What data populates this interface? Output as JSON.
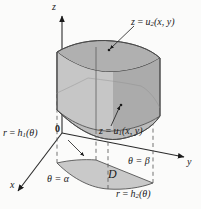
{
  "figure": {
    "background_color": "#fbfbfa",
    "axes": {
      "z_label": "z",
      "y_label": "y",
      "x_label": "x",
      "origin_label": "0",
      "axis_color": "#2b2b2b"
    },
    "labels": {
      "top_surface": {
        "lhs": "z",
        "eq": " = ",
        "fn": "u",
        "sub": "2",
        "args": "(x, y)"
      },
      "bottom_surface": {
        "lhs": "z",
        "eq": " = ",
        "fn": "u",
        "sub": "1",
        "args": "(x, y)"
      },
      "inner_radius": {
        "lhs": "r",
        "eq": " = ",
        "fn": "h",
        "sub": "1",
        "args": "(θ)"
      },
      "outer_radius": {
        "lhs": "r",
        "eq": " = ",
        "fn": "h",
        "sub": "2",
        "args": "(θ)"
      },
      "theta_start": "θ = α",
      "theta_end": "θ = β",
      "region": "D"
    },
    "colors": {
      "solid_light": "#c9c9c9",
      "solid_mid": "#b4b4b4",
      "solid_dark": "#a2a2a2",
      "solid_top": "#b8b8b8",
      "region_fill": "#c4c4c4",
      "outline": "#4a4a4a",
      "dashed": "#5a5a5a",
      "leader": "#1a1a1a"
    }
  }
}
